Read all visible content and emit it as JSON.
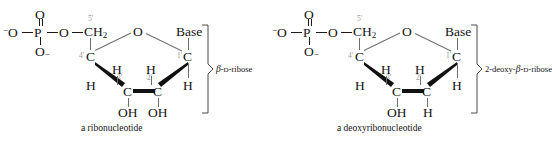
{
  "figure": {
    "background_color": "#ffffff",
    "bond_color": "#1b1b1b",
    "locant_color": "#9a9a9a",
    "ring_bond_color": "#6e6e6e"
  },
  "units": [
    {
      "id": "ribonucleotide",
      "caption": "a ribonucleotide",
      "sugar_label": {
        "prefix": "",
        "greek": "β",
        "dash1": "-",
        "smallcaps": "D",
        "suffix": "-ribose"
      },
      "sugar_label_text": "β-D-ribose",
      "phosphate": {
        "p": "P",
        "o_top": "O",
        "o_left": "O",
        "o_left_charge": "−",
        "o_bottom": "O",
        "o_bottom_charge": "−",
        "o_bridge": "O"
      },
      "atoms": {
        "ch2": "CH",
        "ch2_sub": "2",
        "ring_o": "O",
        "c4": "C",
        "c1": "C",
        "c3": "C",
        "c2": "C",
        "base": "Base",
        "h_c4_down": "H",
        "h_c1_down": "H",
        "h_c3_up": "H",
        "h_c2_up": "H",
        "sub_c3": "OH",
        "sub_c2": "OH"
      },
      "locants": {
        "five": "5'",
        "four": "4'",
        "three": "3'",
        "two": "2'",
        "one": "1'"
      }
    },
    {
      "id": "deoxyribonucleotide",
      "caption": "a deoxyribonucleotide",
      "sugar_label": {
        "prefix": "2-deoxy-",
        "greek": "β",
        "dash1": "-",
        "smallcaps": "D",
        "suffix": "-ribose"
      },
      "sugar_label_text": "2-deoxy-β-D-ribose",
      "phosphate": {
        "p": "P",
        "o_top": "O",
        "o_left": "O",
        "o_left_charge": "−",
        "o_bottom": "O",
        "o_bottom_charge": "−",
        "o_bridge": "O"
      },
      "atoms": {
        "ch2": "CH",
        "ch2_sub": "2",
        "ring_o": "O",
        "c4": "C",
        "c1": "C",
        "c3": "C",
        "c2": "C",
        "base": "Base",
        "h_c4_down": "H",
        "h_c1_down": "H",
        "h_c3_up": "H",
        "h_c2_up": "H",
        "sub_c3": "OH",
        "sub_c2": "H"
      },
      "locants": {
        "five": "5'",
        "four": "4'",
        "three": "3'",
        "two": "2'",
        "one": "1'"
      }
    }
  ]
}
